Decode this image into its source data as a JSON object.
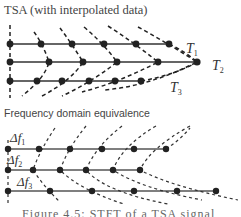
{
  "top_panel": {
    "title": "TSA (with interpolated data)",
    "rows": [
      {
        "label": "T",
        "subscript": "1",
        "y": 44,
        "points_x": [
          10,
          41,
          72,
          104,
          136,
          169
        ]
      },
      {
        "label": "T",
        "subscript": "2",
        "y": 62,
        "points_x": [
          10,
          49,
          83,
          117,
          158,
          197
        ]
      },
      {
        "label": "T",
        "subscript": "3",
        "y": 81,
        "points_x": [
          10,
          37,
          62,
          89,
          115,
          141
        ]
      }
    ]
  },
  "bottom_panel": {
    "title": "Frequency domain equivalence",
    "rows": [
      {
        "label": "Δf",
        "subscript": "1",
        "y": 149,
        "points_x": [
          8,
          39,
          70,
          102,
          134,
          166
        ]
      },
      {
        "label": "Δf",
        "subscript": "2",
        "y": 170,
        "points_x": [
          8,
          33,
          60,
          86,
          113,
          140
        ]
      },
      {
        "label": "Δf",
        "subscript": "3",
        "y": 191,
        "points_x": [
          8,
          50,
          92,
          134,
          177,
          216
        ]
      }
    ]
  },
  "caption": "Figure 4.5: STFT of a TSA signal",
  "colors": {
    "line": "#333333",
    "dot": "#222222",
    "dash": "#222222",
    "bottom_line": "#555555"
  }
}
